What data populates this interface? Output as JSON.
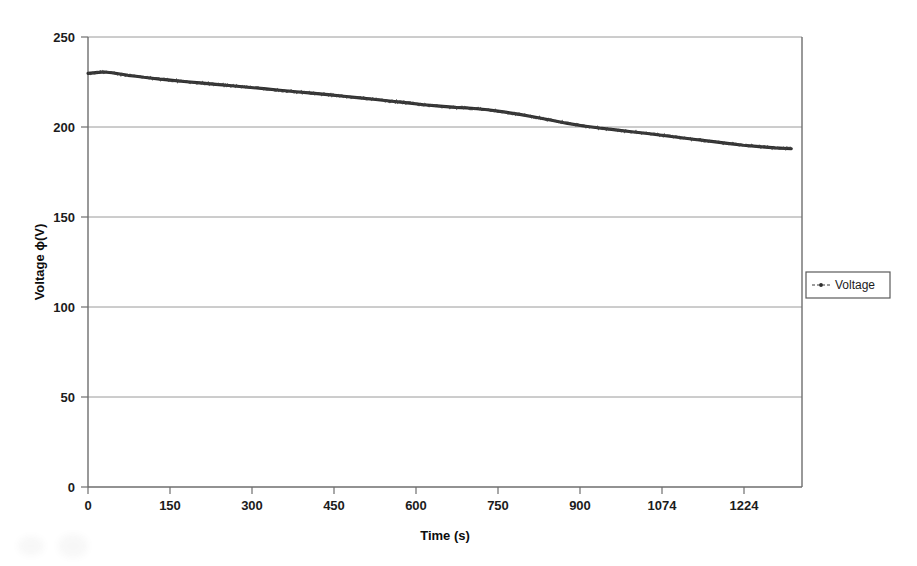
{
  "chart_data": {
    "type": "line",
    "title": "",
    "xlabel": "Time (s)",
    "ylabel": "Voltage ɸ(V)",
    "xlim": [
      0,
      1340
    ],
    "ylim": [
      0,
      250
    ],
    "grid": true,
    "legend_position": "right",
    "xticks": [
      0,
      150,
      300,
      450,
      600,
      750,
      900,
      1074,
      1224
    ],
    "xtick_labels": [
      "0",
      "150",
      "300",
      "450",
      "600",
      "750",
      "900",
      "1074",
      "1224"
    ],
    "yticks": [
      0,
      50,
      100,
      150,
      200,
      250
    ],
    "ytick_labels": [
      "0",
      "50",
      "100",
      "150",
      "200",
      "250"
    ],
    "series": [
      {
        "name": "Voltage",
        "color": "#2e2e2e",
        "marker": "dot",
        "x": [
          0,
          15,
          30,
          45,
          60,
          75,
          90,
          105,
          120,
          135,
          150,
          180,
          210,
          240,
          270,
          300,
          330,
          360,
          390,
          420,
          450,
          480,
          510,
          540,
          570,
          600,
          630,
          660,
          690,
          720,
          750,
          780,
          810,
          840,
          870,
          900,
          930,
          960,
          990,
          1020,
          1050,
          1080,
          1110,
          1140,
          1170,
          1200,
          1230,
          1260,
          1290,
          1320
        ],
        "y": [
          229.8,
          230.2,
          230.6,
          230.1,
          229.4,
          228.7,
          228.2,
          227.6,
          227.1,
          226.6,
          226.2,
          225.3,
          224.5,
          223.7,
          222.9,
          222.1,
          221.3,
          220.4,
          219.6,
          218.8,
          218.0,
          217.1,
          216.2,
          215.3,
          214.3,
          213.4,
          212.4,
          211.6,
          210.9,
          210.4,
          209.6,
          208.4,
          207.0,
          205.4,
          203.7,
          202.0,
          200.6,
          199.4,
          198.4,
          197.4,
          196.4,
          195.3,
          194.2,
          193.1,
          192.0,
          190.9,
          189.9,
          189.1,
          188.4,
          187.9
        ],
        "notes": "Battery discharge curve: starts ~230 V, small rise to ~230.6 V near t=30 s, monotonic decay crossing 200 V near t~900 s, flattening to ~188 V at the end. Trace is noisy/thick (dense overlapping point markers)."
      }
    ],
    "legend_entries": [
      "Voltage"
    ]
  },
  "legend": {
    "entries": [
      {
        "label": "Voltage",
        "marker": "dot-dashed-line"
      }
    ]
  },
  "axes": {
    "x_title": "Time (s)",
    "y_title": "Voltage ɸ(V)"
  }
}
